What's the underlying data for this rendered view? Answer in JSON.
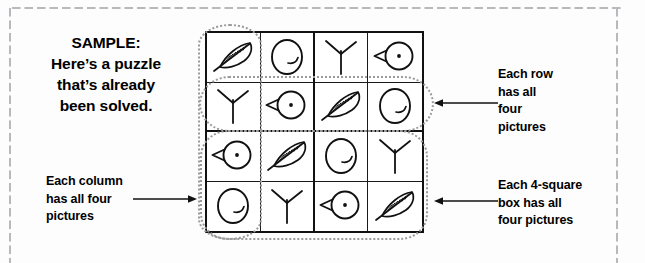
{
  "page": {
    "background_color": "#fdfdfd",
    "border_dot_color": "#b9b9bd",
    "ink_color": "#111111",
    "highlight_dot_color": "#9a9a9a"
  },
  "sample_caption": {
    "name": "sample-caption",
    "lines": [
      "SAMPLE:",
      "Here’s a puzzle",
      "that’s already",
      "been solved."
    ]
  },
  "callouts": {
    "row": {
      "lines": [
        "Each row",
        "has all",
        "four",
        "pictures"
      ],
      "arrow_direction": "left"
    },
    "box": {
      "lines": [
        "Each 4-square",
        "box has all",
        "four pictures"
      ],
      "arrow_direction": "left"
    },
    "column": {
      "lines": [
        "Each column",
        "has all four",
        "pictures"
      ],
      "arrow_direction": "right"
    }
  },
  "puzzle": {
    "name": "sudoku-picture-puzzle",
    "size": 4,
    "box_size": 2,
    "icon_names": [
      "feather-icon",
      "egg-icon",
      "bird-track-icon",
      "bird-head-icon"
    ],
    "rows": [
      [
        "feather",
        "egg",
        "track",
        "head"
      ],
      [
        "track",
        "head",
        "feather",
        "egg"
      ],
      [
        "head",
        "feather",
        "egg",
        "track"
      ],
      [
        "egg",
        "track",
        "head",
        "feather"
      ]
    ]
  },
  "highlights": [
    {
      "name": "column-highlight",
      "target": "column-1"
    },
    {
      "name": "row-highlight",
      "target": "row-2"
    },
    {
      "name": "box-highlight",
      "target": "bottom-boxes"
    }
  ]
}
